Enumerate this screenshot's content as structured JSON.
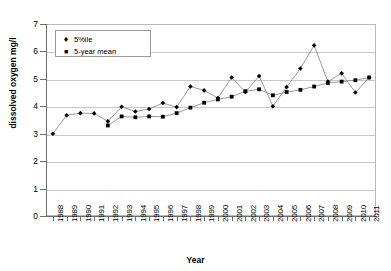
{
  "chart_data": {
    "type": "line",
    "title": "",
    "xlabel": "Year",
    "ylabel": "dissolved oxygen mg/l",
    "ylim": [
      0,
      7
    ],
    "yticks": [
      0,
      1,
      2,
      3,
      4,
      5,
      6,
      7
    ],
    "grid": true,
    "legend_position": "top-left",
    "categories": [
      "1988",
      "1989",
      "1990",
      "1991",
      "1992",
      "1993",
      "1994",
      "1995",
      "1996",
      "1997",
      "1998",
      "1999",
      "2000",
      "2001",
      "2002",
      "2003",
      "2004",
      "2005",
      "2006",
      "2007",
      "2008",
      "2009",
      "2010",
      "2011"
    ],
    "series": [
      {
        "name": "5%ile",
        "marker": "diamond",
        "values": [
          3.0,
          3.67,
          3.75,
          3.74,
          3.45,
          3.98,
          3.81,
          3.9,
          4.12,
          3.97,
          4.72,
          4.58,
          4.3,
          5.05,
          4.52,
          5.1,
          4.0,
          4.7,
          5.38,
          6.22,
          4.9,
          5.2,
          4.5,
          5.05
        ]
      },
      {
        "name": "5-year mean",
        "marker": "square",
        "values": [
          null,
          null,
          null,
          null,
          3.3,
          3.63,
          3.6,
          3.63,
          3.62,
          3.75,
          3.95,
          4.13,
          4.25,
          4.35,
          4.55,
          4.62,
          4.4,
          4.52,
          4.6,
          4.72,
          4.85,
          4.9,
          4.95,
          5.05
        ]
      }
    ],
    "legend": [
      {
        "label": "5%ile",
        "marker": "♦"
      },
      {
        "label": "5-year mean",
        "marker": "■"
      }
    ],
    "colors": {
      "line": "#808080",
      "marker": "#000000",
      "grid": "#c8c8c8",
      "axis": "#6e6e6e"
    }
  }
}
